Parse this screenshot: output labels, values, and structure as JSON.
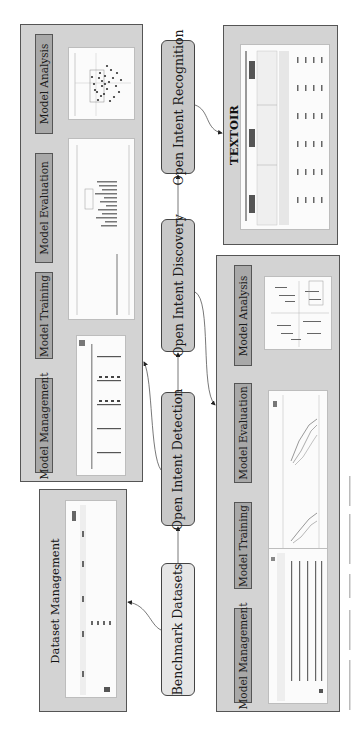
{
  "core_nodes": {
    "recognition": "Open Intent Recognition",
    "discovery": "Open Intent Discovery",
    "detection": "Open Intent Detection",
    "benchmark": "Benchmark Datasets"
  },
  "detection_panel": {
    "stages": [
      "Model Analysis",
      "Model Evaluation",
      "Model Training",
      "Model Management"
    ]
  },
  "discovery_panel": {
    "stages": [
      "Model Analysis",
      "Model Evaluation",
      "Model Training",
      "Model Management"
    ]
  },
  "dataset_panel": {
    "title": "Dataset Management"
  },
  "textoir_panel": {
    "title": "TEXTOIR"
  },
  "colors": {
    "panel_bg": "#d3d3d3",
    "stage_box": "#a8a8a8",
    "core_box": "#c8c8c8",
    "benchmark_box": "#e6e6e6",
    "border": "#555555"
  }
}
